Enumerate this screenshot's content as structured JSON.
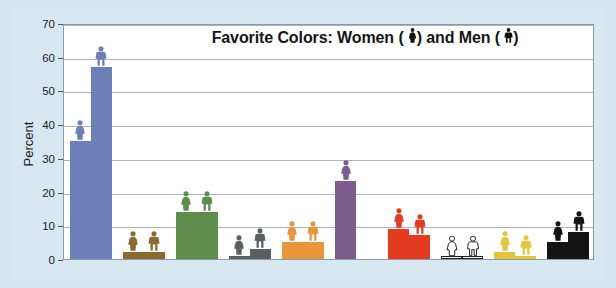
{
  "chart_data": {
    "type": "bar",
    "title_text_before": "Favorite Colors:  Women (",
    "title_text_middle": ") and Men (",
    "title_text_after": ")",
    "xlabel": "",
    "ylabel": "Percent",
    "ylim": [
      0,
      70
    ],
    "ytick_labels": [
      "0",
      "10",
      "20",
      "30",
      "40",
      "50",
      "60",
      "70"
    ],
    "yticks": [
      0,
      10,
      20,
      30,
      40,
      50,
      60,
      70
    ],
    "grid": true,
    "legend_position": "in-title",
    "categories": [
      "Blue",
      "Brown",
      "Green",
      "Gray",
      "Orange",
      "Purple",
      "Red",
      "White",
      "Yellow",
      "Black"
    ],
    "category_colors": [
      "#6c7fb8",
      "#8a6a2e",
      "#5e8d4b",
      "#5a5f62",
      "#e8963c",
      "#7c5b8d",
      "#e43a20",
      "#ffffff",
      "#e5c53c",
      "#141414"
    ],
    "series": [
      {
        "name": "Women",
        "icon": "female-figure-icon",
        "values": [
          35,
          2,
          14,
          1,
          5,
          23,
          9,
          1,
          2,
          5
        ]
      },
      {
        "name": "Men",
        "icon": "male-figure-icon",
        "values": [
          57,
          2,
          14,
          3,
          5,
          null,
          7,
          1,
          1,
          8
        ]
      }
    ]
  },
  "figure": {
    "background_color": "#d8e8f2",
    "plot_background_color": "#ffffff",
    "gridline_color": "#a9b4bc",
    "frame_color": "#8a9aa6"
  }
}
